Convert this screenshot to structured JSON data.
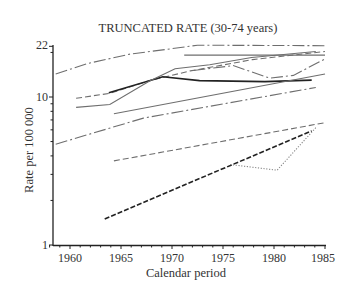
{
  "chart_data": {
    "type": "line",
    "title": "TRUNCATED RATE (30-74 years)",
    "xlabel": "Calendar period",
    "ylabel": "Rate per 100 000",
    "yscale": "log",
    "xlim": [
      1958.3,
      1985.5
    ],
    "ylim": [
      1,
      22
    ],
    "x_ticks": [
      "1960",
      "1965",
      "1970",
      "1975",
      "1980",
      "1985"
    ],
    "y_ticks": [
      "1",
      "10",
      "22"
    ],
    "grid": false,
    "legend": "none",
    "series": [
      {
        "name": "series-1",
        "style": "dashdot",
        "color": "#6e6e6e",
        "x": [
          1958.6,
          1961.8,
          1965.9,
          1969.3,
          1972.5,
          1985
        ],
        "values": [
          14.3,
          16.9,
          19.5,
          20.9,
          22.4,
          22.2
        ]
      },
      {
        "name": "series-2",
        "style": "solid",
        "color": "#6e6e6e",
        "x": [
          1971.2,
          1985
        ],
        "values": [
          19.2,
          19.2
        ]
      },
      {
        "name": "series-3",
        "style": "dashed",
        "color": "#6e6e6e",
        "x": [
          1960.6,
          1963.9,
          1967.8,
          1971.8,
          1977.9,
          1985
        ],
        "values": [
          9.8,
          10.6,
          12.9,
          15.0,
          17.9,
          20.3
        ]
      },
      {
        "name": "series-4",
        "style": "solid-bold",
        "color": "#222222",
        "x": [
          1963.8,
          1969.1,
          1972.7,
          1979.1,
          1983.7
        ],
        "values": [
          10.7,
          13.7,
          12.9,
          12.7,
          13.0
        ]
      },
      {
        "name": "series-5",
        "style": "solid",
        "color": "#6e6e6e",
        "x": [
          1960.6,
          1963.9,
          1967.8,
          1970.3,
          1973.7,
          1977.8,
          1984.1
        ],
        "values": [
          8.5,
          8.9,
          12.8,
          15.5,
          16.5,
          18.5,
          20.3
        ]
      },
      {
        "name": "series-6",
        "style": "dashdot",
        "color": "#6e6e6e",
        "x": [
          1972.1,
          1976.0,
          1979.6,
          1981.9,
          1985
        ],
        "values": [
          15.1,
          16.3,
          13.4,
          14.0,
          18.1
        ]
      },
      {
        "name": "series-7",
        "style": "solid",
        "color": "#6e6e6e",
        "x": [
          1964.3,
          1985
        ],
        "values": [
          7.7,
          14.3
        ]
      },
      {
        "name": "series-8",
        "style": "dashdot",
        "color": "#6e6e6e",
        "x": [
          1958.6,
          1967.2,
          1984.1
        ],
        "values": [
          4.8,
          7.2,
          11.6
        ]
      },
      {
        "name": "series-9",
        "style": "dashed",
        "color": "#6e6e6e",
        "x": [
          1964.3,
          1985
        ],
        "values": [
          3.7,
          6.7
        ]
      },
      {
        "name": "series-10",
        "style": "dashed-bold",
        "color": "#222222",
        "x": [
          1963.4,
          1983.7
        ],
        "values": [
          1.5,
          5.9
        ]
      },
      {
        "name": "series-11",
        "style": "dotted",
        "color": "#888888",
        "x": [
          1975.7,
          1980.3,
          1984.1
        ],
        "values": [
          3.5,
          3.2,
          6.2
        ]
      }
    ]
  },
  "figure": {
    "title": "TRUNCATED RATE (30-74 years)",
    "xlabel": "Calendar period",
    "ylabel": "Rate per 100 000",
    "x_ticks": [
      "1960",
      "1965",
      "1970",
      "1975",
      "1980",
      "1985"
    ],
    "y_ticks": [
      "22",
      "10",
      "1"
    ]
  }
}
